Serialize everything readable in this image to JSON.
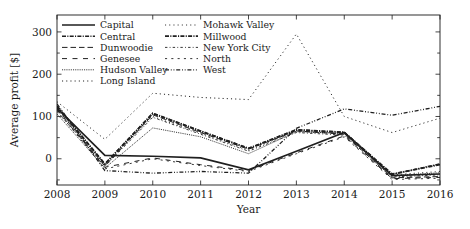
{
  "chart_data": {
    "type": "line",
    "title": "",
    "xlabel": "Year",
    "ylabel": "Average profit [$]",
    "x": [
      2008,
      2009,
      2010,
      2011,
      2012,
      2013,
      2014,
      2015,
      2016
    ],
    "xticklabels": [
      "2008",
      "2009",
      "2010",
      "2011",
      "2012",
      "2013",
      "2014",
      "2015",
      "2016"
    ],
    "yticklabels": [
      "0",
      "100",
      "200",
      "300"
    ],
    "ytickvalues": [
      0,
      100,
      200,
      300
    ],
    "xlim": [
      2008,
      2016
    ],
    "ylim": [
      -62,
      340
    ],
    "grid": false,
    "legend_position": "upper-left-inside-two-columns",
    "series": [
      {
        "name": "Capital",
        "dash": "none",
        "width": 1.7,
        "values": [
          120,
          8,
          6,
          2,
          -26,
          18,
          62,
          -40,
          -36
        ]
      },
      {
        "name": "Central",
        "dash": "dashdot-dense",
        "width": 1.5,
        "values": [
          125,
          -12,
          108,
          66,
          25,
          69,
          63,
          -37,
          -12
        ]
      },
      {
        "name": "Dunwoodie",
        "dash": "long-dash",
        "width": 1.0,
        "values": [
          118,
          -17,
          104,
          62,
          23,
          66,
          58,
          -45,
          -42
        ]
      },
      {
        "name": "Genesee",
        "dash": "dash-wide",
        "width": 1.0,
        "values": [
          116,
          -20,
          2,
          -14,
          -28,
          14,
          54,
          -47,
          -44
        ]
      },
      {
        "name": "Hudson Valley",
        "dash": "fine-dot",
        "width": 0.9,
        "values": [
          106,
          -22,
          73,
          52,
          12,
          64,
          60,
          -40,
          -33
        ]
      },
      {
        "name": "Long Island",
        "dash": "dot-sparse",
        "width": 1.0,
        "values": [
          135,
          46,
          155,
          145,
          140,
          295,
          100,
          62,
          96
        ]
      },
      {
        "name": "Mohawk Valley",
        "dash": "dot-sparse",
        "width": 0.9,
        "values": [
          121,
          -14,
          100,
          60,
          20,
          65,
          60,
          -38,
          -30
        ]
      },
      {
        "name": "Millwood",
        "dash": "dashdot-dense",
        "width": 1.8,
        "values": [
          124,
          -13,
          107,
          65,
          24,
          68,
          62,
          -36,
          -14
        ]
      },
      {
        "name": "New York City",
        "dash": "dash-dot-loose",
        "width": 0.9,
        "values": [
          112,
          -18,
          98,
          58,
          18,
          62,
          56,
          -43,
          -38
        ]
      },
      {
        "name": "North",
        "dash": "dash-loose",
        "width": 0.9,
        "values": [
          114,
          -24,
          0,
          -16,
          -30,
          12,
          52,
          -49,
          -46
        ]
      },
      {
        "name": "West",
        "dash": "dash-dot-dot",
        "width": 1.3,
        "values": [
          130,
          -28,
          -34,
          -30,
          -34,
          72,
          118,
          103,
          124
        ]
      }
    ]
  },
  "legend": {
    "column1": [
      "Capital",
      "Central",
      "Dunwoodie",
      "Genesee",
      "Hudson Valley",
      "Long Island"
    ],
    "column2": [
      "Mohawk Valley",
      "Millwood",
      "New York City",
      "North",
      "West"
    ]
  }
}
